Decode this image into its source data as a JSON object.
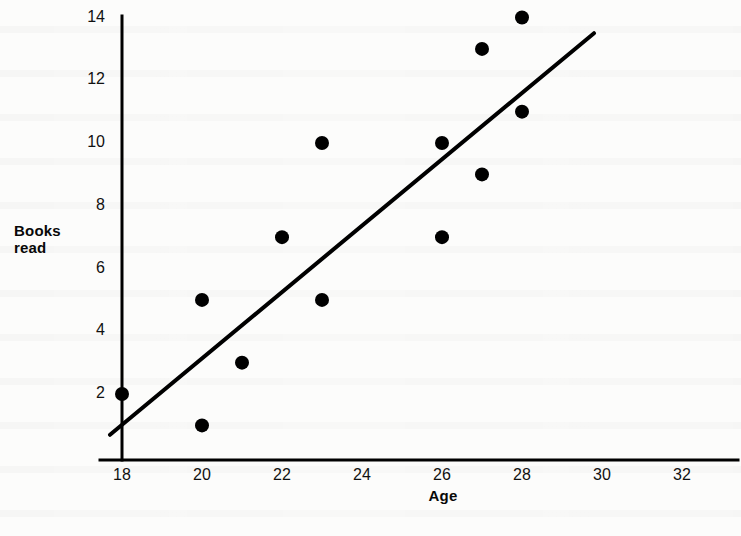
{
  "chart_data": {
    "type": "scatter",
    "title": "",
    "xlabel": "Age",
    "ylabel": "Books read",
    "xlim": [
      17.4,
      33.2
    ],
    "ylim": [
      0,
      14.6
    ],
    "grid": false,
    "legend": "none",
    "x_ticks": [
      18,
      20,
      22,
      24,
      26,
      28,
      30,
      32
    ],
    "y_ticks": [
      2,
      4,
      6,
      8,
      10,
      12,
      14
    ],
    "x_tick_labels": [
      "18",
      "20",
      "22",
      "24",
      "26",
      "28",
      "30",
      "32"
    ],
    "y_tick_labels": [
      "2",
      "4",
      "6",
      "8",
      "10",
      "12",
      "14"
    ],
    "points": [
      {
        "x": 18,
        "y": 2
      },
      {
        "x": 20,
        "y": 1
      },
      {
        "x": 20,
        "y": 5
      },
      {
        "x": 21,
        "y": 3
      },
      {
        "x": 22,
        "y": 7
      },
      {
        "x": 23,
        "y": 5
      },
      {
        "x": 23,
        "y": 10
      },
      {
        "x": 26,
        "y": 7
      },
      {
        "x": 26,
        "y": 10
      },
      {
        "x": 27,
        "y": 9
      },
      {
        "x": 27,
        "y": 13
      },
      {
        "x": 28,
        "y": 11
      },
      {
        "x": 28,
        "y": 14
      }
    ],
    "trend_line": {
      "name": "line of best fit",
      "x_start": 17.7,
      "y_start": 0.7,
      "x_end": 29.8,
      "y_end": 13.5
    },
    "marker": {
      "shape": "filled-circle",
      "radius": 7,
      "color": "#000000"
    },
    "colors": {
      "axis": "#000000",
      "marker": "#000000",
      "trend_line": "#000000",
      "text": "#0a0a0a",
      "background": "#fcfcfb"
    }
  },
  "axis_titles": {
    "y": "Books\nread",
    "y_line1": "Books",
    "y_line2": "read",
    "x": "Age"
  }
}
